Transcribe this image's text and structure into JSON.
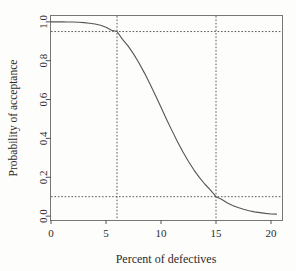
{
  "chart_data": {
    "type": "line",
    "title": "",
    "xlabel": "Percent of defectives",
    "ylabel": "Probability of acceptance",
    "xlim": [
      0,
      21
    ],
    "ylim": [
      -0.02,
      1.03
    ],
    "grid": false,
    "legend": null,
    "xticks": [
      0,
      5,
      10,
      15,
      20
    ],
    "xtick_labels": [
      "0",
      "5",
      "10",
      "15",
      "20"
    ],
    "yticks": [
      0.0,
      0.2,
      0.4,
      0.6,
      0.8,
      1.0
    ],
    "ytick_labels": [
      "0.0",
      "0.2",
      "0.4",
      "0.6",
      "0.8",
      "1.0"
    ],
    "series": [
      {
        "name": "OC curve",
        "color": "#555555",
        "x": [
          0.0,
          0.5,
          1.0,
          1.5,
          2.0,
          2.5,
          3.0,
          3.5,
          4.0,
          4.5,
          5.0,
          5.5,
          6.0,
          6.5,
          7.0,
          7.5,
          8.0,
          8.5,
          9.0,
          9.5,
          10.0,
          10.5,
          11.0,
          11.5,
          12.0,
          12.5,
          13.0,
          13.5,
          14.0,
          14.5,
          15.0,
          15.5,
          16.0,
          16.5,
          17.0,
          17.5,
          18.0,
          18.5,
          19.0,
          19.5,
          20.0,
          20.5
        ],
        "y": [
          1.0,
          1.0,
          1.0,
          0.999,
          0.999,
          0.998,
          0.996,
          0.993,
          0.989,
          0.982,
          0.972,
          0.957,
          0.95,
          0.91,
          0.876,
          0.835,
          0.788,
          0.736,
          0.68,
          0.621,
          0.56,
          0.499,
          0.44,
          0.383,
          0.33,
          0.281,
          0.237,
          0.198,
          0.164,
          0.134,
          0.1,
          0.087,
          0.069,
          0.055,
          0.044,
          0.035,
          0.028,
          0.022,
          0.018,
          0.014,
          0.011,
          0.01
        ]
      }
    ],
    "reference_lines": [
      {
        "name": "producer-risk-level",
        "orientation": "horizontal",
        "value": 0.95,
        "style": "dashed"
      },
      {
        "name": "consumer-risk-level",
        "orientation": "horizontal",
        "value": 0.1,
        "style": "dashed"
      },
      {
        "name": "aql",
        "orientation": "vertical",
        "value": 6,
        "style": "dashed"
      },
      {
        "name": "ltpd",
        "orientation": "vertical",
        "value": 15,
        "style": "dashed"
      }
    ]
  }
}
